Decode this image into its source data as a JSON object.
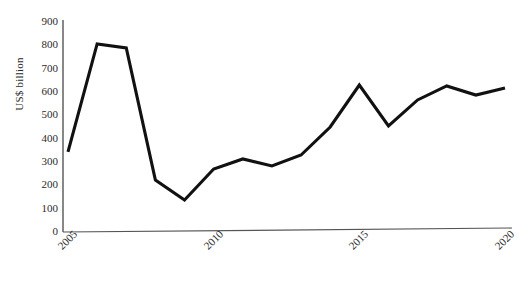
{
  "chart_data": {
    "type": "line",
    "title": "",
    "xlabel": "",
    "ylabel": "US$ billion",
    "x": [
      2005,
      2006,
      2007,
      2008,
      2009,
      2010,
      2011,
      2012,
      2013,
      2014,
      2015,
      2016,
      2017,
      2018,
      2019,
      2020
    ],
    "values": [
      343,
      806,
      789,
      223,
      137,
      270,
      313,
      283,
      330,
      450,
      630,
      455,
      566,
      626,
      587,
      617
    ],
    "series": [
      {
        "name": "US$ billion",
        "values": [
          343,
          806,
          789,
          223,
          137,
          270,
          313,
          283,
          330,
          450,
          630,
          455,
          566,
          626,
          587,
          617
        ]
      }
    ],
    "xlim": [
      2005,
      2020
    ],
    "ylim": [
      0,
      900
    ],
    "ytick_labels": [
      "0",
      "100",
      "200",
      "300",
      "400",
      "500",
      "600",
      "700",
      "800",
      "900"
    ],
    "ytick_values": [
      0,
      100,
      200,
      300,
      400,
      500,
      600,
      700,
      800,
      900
    ],
    "xtick_labels": [
      "2005",
      "2010",
      "2015",
      "2020"
    ],
    "xtick_values": [
      2005,
      2010,
      2015,
      2020
    ],
    "grid": false,
    "legend": false,
    "line_color": "#111111",
    "axis_color": "#555555",
    "background_color": "#ffffff"
  }
}
